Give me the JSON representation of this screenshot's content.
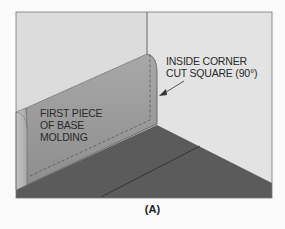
{
  "figure": {
    "caption": "(A)",
    "labels": {
      "molding": [
        "FIRST PIECE",
        "OF BASE",
        "MOLDING"
      ],
      "corner": [
        "INSIDE CORNER",
        "CUT SQUARE (90°)"
      ]
    },
    "colors": {
      "background": "#fbfbfb",
      "wall_left": "#dcdcdc",
      "wall_right": "#e2e2e2",
      "molding_face": "#9a9a9a",
      "molding_top": "#b5b5b5",
      "floor": "#5a5a5a",
      "outline": "#444444"
    }
  }
}
